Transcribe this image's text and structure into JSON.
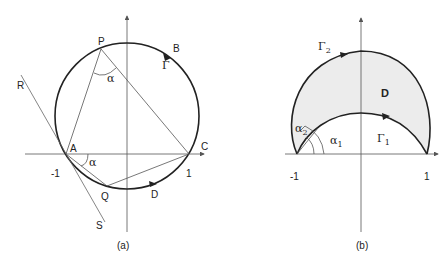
{
  "figures": [
    {
      "id": "a",
      "caption": "(a)",
      "points": {
        "P": "P",
        "B": "B",
        "R": "R",
        "A": "A",
        "C": "C",
        "Q": "Q",
        "D": "D",
        "S": "S"
      },
      "curve_label": "Γ",
      "angle_label_P": "α",
      "angle_label_A": "α",
      "tick_neg": "-1",
      "tick_pos": "1"
    },
    {
      "id": "b",
      "caption": "(b)",
      "region_label": "D",
      "outer_curve": {
        "sym": "Γ",
        "sub": "2"
      },
      "inner_curve": {
        "sym": "Γ",
        "sub": "1"
      },
      "angle_outer": {
        "sym": "α",
        "sub": "2"
      },
      "angle_inner": {
        "sym": "α",
        "sub": "1"
      },
      "tick_neg": "-1",
      "tick_pos": "1"
    }
  ],
  "colors": {
    "stroke": "#222222",
    "thin": "#555555",
    "fill": "#ececec"
  }
}
